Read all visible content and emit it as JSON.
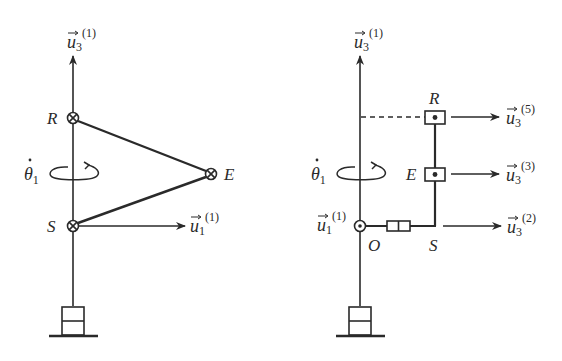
{
  "figure": {
    "left_panel": {
      "axis_label": {
        "base": "u",
        "sub": "3",
        "sup": "(1)"
      },
      "joint_labels": {
        "R": "R",
        "E": "E",
        "S": "S"
      },
      "rotation_label": {
        "base": "θ",
        "sub": "1",
        "dot": "˙"
      },
      "x_axis_label": {
        "base": "u",
        "sub": "1",
        "sup": "(1)"
      }
    },
    "right_panel": {
      "axis_label": {
        "base": "u",
        "sub": "3",
        "sup": "(1)"
      },
      "joint_labels": {
        "R": "R",
        "E": "E",
        "S": "S",
        "O": "O"
      },
      "rotation_label": {
        "base": "θ",
        "sub": "1",
        "dot": "˙"
      },
      "origin_axis_label": {
        "base": "u",
        "sub": "1",
        "sup": "(1)"
      },
      "arrow_labels": [
        {
          "base": "u",
          "sub": "3",
          "sup": "(5)"
        },
        {
          "base": "u",
          "sub": "3",
          "sup": "(3)"
        },
        {
          "base": "u",
          "sub": "3",
          "sup": "(2)"
        }
      ]
    },
    "colors": {
      "stroke": "#2a2a2a",
      "background": "#ffffff"
    }
  }
}
